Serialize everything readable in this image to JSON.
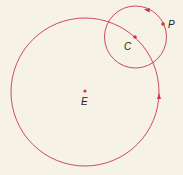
{
  "diagram": {
    "type": "orbit-diagram",
    "colors": {
      "background": "#f7f2e6",
      "line": "#c8384a",
      "text": "#222222"
    },
    "large_orbit": {
      "center_label": "E",
      "cx": 85,
      "cy": 92,
      "r": 74,
      "direction": "counterclockwise"
    },
    "small_orbit": {
      "center_label": "C",
      "cx": 135.5,
      "cy": 37,
      "r": 31,
      "direction": "counterclockwise"
    },
    "points": [
      {
        "label": "E",
        "x": 85,
        "y": 91
      },
      {
        "label": "C",
        "x": 135,
        "y": 37
      },
      {
        "label": "P",
        "x": 163,
        "y": 24
      }
    ],
    "labels": {
      "E": "E",
      "C": "C",
      "P": "P"
    }
  }
}
